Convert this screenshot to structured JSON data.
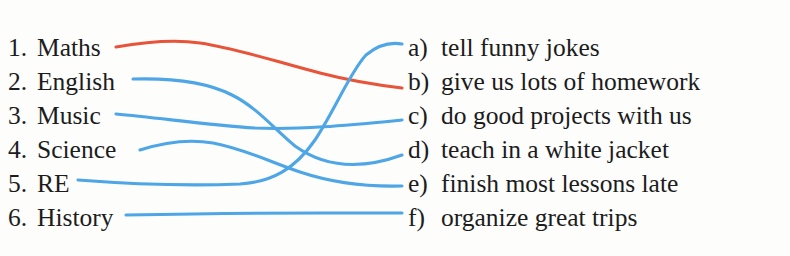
{
  "exercise": {
    "background_color": "#fdfdfc",
    "text_color": "#1c1c1c"
  },
  "colors": {
    "blue_line": "#4ea6e6",
    "red_line": "#e8543a"
  },
  "left_column": {
    "items": [
      {
        "marker": "1.",
        "label": "Maths"
      },
      {
        "marker": "2.",
        "label": "English"
      },
      {
        "marker": "3.",
        "label": "Music"
      },
      {
        "marker": "4.",
        "label": "Science"
      },
      {
        "marker": "5.",
        "label": "RE"
      },
      {
        "marker": "6.",
        "label": "History"
      }
    ]
  },
  "right_column": {
    "items": [
      {
        "marker": "a)",
        "label": "tell funny jokes"
      },
      {
        "marker": "b)",
        "label": "give us lots of homework"
      },
      {
        "marker": "c)",
        "label": "do good projects with us"
      },
      {
        "marker": "d)",
        "label": "teach in a white jacket"
      },
      {
        "marker": "e)",
        "label": "finish most lessons late"
      },
      {
        "marker": "f)",
        "label": "organize great trips"
      }
    ]
  },
  "connections": [
    {
      "from": "1",
      "to": "b",
      "color": "#e8543a",
      "path": "M 116 47 C 150 41, 180 40, 200 43 C 240 49, 280 63, 320 73 C 355 82, 385 86, 402 88"
    },
    {
      "from": "2",
      "to": "d",
      "color": "#4ea6e6",
      "path": "M 133 79 C 170 78, 205 81, 232 95 C 258 108, 275 130, 295 146 C 320 164, 355 172, 402 155"
    },
    {
      "from": "3",
      "to": "c",
      "color": "#4ea6e6",
      "path": "M 116 114 C 160 118, 210 125, 255 128 C 300 130, 350 125, 402 120"
    },
    {
      "from": "4",
      "to": "e",
      "color": "#4ea6e6",
      "path": "M 140 150 C 165 142, 190 139, 213 143 C 245 149, 270 162, 300 172 C 330 182, 365 187, 402 186"
    },
    {
      "from": "5",
      "to": "a",
      "color": "#4ea6e6",
      "path": "M 78 180 C 130 184, 190 186, 240 184 C 272 182, 295 169, 315 140 C 335 110, 350 72, 366 55 C 378 45, 390 42, 402 44"
    },
    {
      "from": "6",
      "to": "f",
      "color": "#4ea6e6",
      "path": "M 126 215 C 180 214, 260 213, 320 213 C 360 213, 385 213, 402 213"
    }
  ]
}
